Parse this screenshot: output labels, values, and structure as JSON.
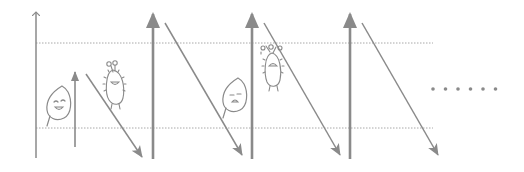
{
  "diagram": {
    "colors": {
      "stroke": "#8a8a8a",
      "dotted": "#a8a8a8",
      "background": "#ffffff"
    },
    "boundaries": {
      "top_y": 43,
      "bottom_y": 128,
      "x_start": 36,
      "x_end": 433
    },
    "vertical_arrows": [
      {
        "x": 36,
        "y1": 158,
        "y2": 12,
        "style": "thin"
      },
      {
        "x": 75,
        "y1": 147,
        "y2": 72,
        "style": "thin-solid-head"
      },
      {
        "x": 153,
        "y1": 159,
        "y2": 14,
        "style": "thick"
      },
      {
        "x": 252,
        "y1": 159,
        "y2": 14,
        "style": "thick"
      },
      {
        "x": 350,
        "y1": 159,
        "y2": 14,
        "style": "thick"
      }
    ],
    "diagonal_arrows": [
      {
        "x1": 86,
        "y1": 74,
        "x2": 142,
        "y2": 157
      },
      {
        "x1": 165,
        "y1": 23,
        "x2": 242,
        "y2": 155
      },
      {
        "x1": 264,
        "y1": 23,
        "x2": 340,
        "y2": 155
      },
      {
        "x1": 362,
        "y1": 23,
        "x2": 438,
        "y2": 155
      }
    ],
    "characters": [
      {
        "type": "leaf",
        "mood": "happy",
        "x": 58,
        "y": 100
      },
      {
        "type": "bug",
        "mood": "happy",
        "x": 115,
        "y": 80
      },
      {
        "type": "leaf",
        "mood": "sad",
        "x": 233,
        "y": 97
      },
      {
        "type": "bug",
        "mood": "hanging",
        "x": 273,
        "y": 64
      }
    ],
    "ellipsis": {
      "count": 6,
      "x_start": 433,
      "spacing": 12.5,
      "y": 89
    }
  }
}
